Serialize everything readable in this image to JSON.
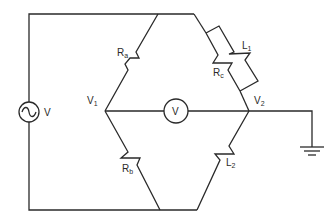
{
  "diagram": {
    "type": "AC bridge circuit",
    "source": {
      "label": "V",
      "symbol": "ac-source"
    },
    "nodes": [
      {
        "id": "V1",
        "label": "V",
        "subscript": "1"
      },
      {
        "id": "V2",
        "label": "V",
        "subscript": "2"
      }
    ],
    "meter": {
      "label": "V",
      "symbol": "voltmeter"
    },
    "components": [
      {
        "id": "Ra",
        "label": "R",
        "subscript": "a",
        "arm": "top-left"
      },
      {
        "id": "Rc",
        "label": "R",
        "subscript": "c",
        "arm": "top-right"
      },
      {
        "id": "L1",
        "label": "L",
        "subscript": "1",
        "arm": "top-right (parallel with Rc)"
      },
      {
        "id": "Rb",
        "label": "R",
        "subscript": "b",
        "arm": "bottom-left"
      },
      {
        "id": "L2",
        "label": "L",
        "subscript": "2",
        "arm": "bottom-right"
      }
    ],
    "ground": {
      "symbol": "ground",
      "connected_to": "V2"
    },
    "colors": {
      "line": "#2a2a2a",
      "background": "#ffffff"
    }
  }
}
